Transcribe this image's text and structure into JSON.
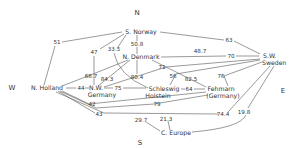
{
  "compass": {
    "north": "N",
    "south": "S",
    "west": "W",
    "east": "E"
  },
  "nodes": {
    "s_norway": "S. Norway",
    "n_denmark": "N. Denmark",
    "sw_sweden_1": "S.W.",
    "sw_sweden_2": "Sweden",
    "n_holland": "N. Holland",
    "nw_germany_1": "N.W.",
    "nw_germany_2": "Germany",
    "schleswig_1": "Schleswig",
    "schleswig_2": "Holstein",
    "fehmarn_1": "Fehmarn",
    "fehmarn_2": "(Germany)",
    "c_europe": "C. Europe"
  },
  "edge_values": {
    "v51": "51",
    "v63": "63",
    "v47": "47",
    "v33_5": "33.5",
    "v50_8": "50.8",
    "v48_7": "48.7",
    "v70": "70",
    "v68_7": "68.7",
    "v84_3": "84.3",
    "v71": "71",
    "v80_4": "80.4",
    "v56": "56",
    "v82_5": "82.5",
    "v76": "76",
    "v44": "44",
    "v75": "75",
    "v64": "64",
    "v42": "42",
    "v79": "79",
    "v43": "43",
    "v74_4": "74.4",
    "v19_8": "19.8",
    "v29_7": "29.7",
    "v21_3": "21.3"
  }
}
